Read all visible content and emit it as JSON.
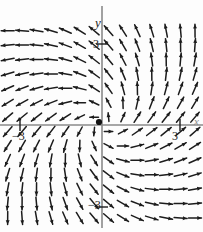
{
  "figure": {
    "kind": "direction-field",
    "background_color": "#fdfdfd",
    "ink_color": "#1a1a1a",
    "axis_color": "#777777",
    "labels": {
      "y_axis": "y",
      "x_axis": "x",
      "y_tick_positive": "3",
      "y_tick_negative": "3",
      "x_tick_negative": "3",
      "x_tick_positive": "3",
      "x_tick_negative_sign": "−3",
      "y_tick_negative_sign": "−3"
    },
    "equilibrium_point": {
      "label": "origin-dot",
      "x": 0,
      "y": 0
    }
  },
  "chart_data": {
    "type": "scatter",
    "title": "",
    "subtitle": "",
    "xlabel": "x",
    "ylabel": "y",
    "xlim": [
      -3.9,
      3.9
    ],
    "ylim": [
      -3.9,
      3.9
    ],
    "xticks": [
      -3,
      3
    ],
    "yticks": [
      -3,
      3
    ],
    "xticklabels": [
      "−3",
      "3"
    ],
    "yticklabels": [
      "−3",
      "3"
    ],
    "grid": false,
    "legend": null,
    "annotations": [
      {
        "text": "y",
        "x": 0.0,
        "y": 4.3,
        "style": "italic"
      },
      {
        "text": "x",
        "x": 4.3,
        "y": 0.0,
        "style": "italic"
      },
      {
        "text": "3",
        "x": -0.35,
        "y": 3.0
      },
      {
        "text": "−3",
        "x": -0.55,
        "y": -3.0
      },
      {
        "text": "−3",
        "x": -3.0,
        "y": -0.5
      },
      {
        "text": "3",
        "x": 3.0,
        "y": -0.5
      }
    ],
    "field": {
      "description": "Counterclockwise spiral source direction field",
      "u_formula": "x - y",
      "v_formula": "x + y",
      "grid_spacing": 0.55,
      "grid_min": -3.6,
      "grid_max": 3.6,
      "arrow_length_px": 13,
      "arrow_head_px": 4.2,
      "equilibrium": [
        0,
        0
      ]
    },
    "series": [
      {
        "name": "direction-field-arrows",
        "kind": "vector-field",
        "values": []
      }
    ]
  },
  "pixel_geometry": {
    "width": 203,
    "height": 232,
    "origin_px": [
      102,
      125
    ],
    "unit_px": 26.2,
    "axis_x_y_px": 125,
    "axis_y_x_px": 102
  }
}
